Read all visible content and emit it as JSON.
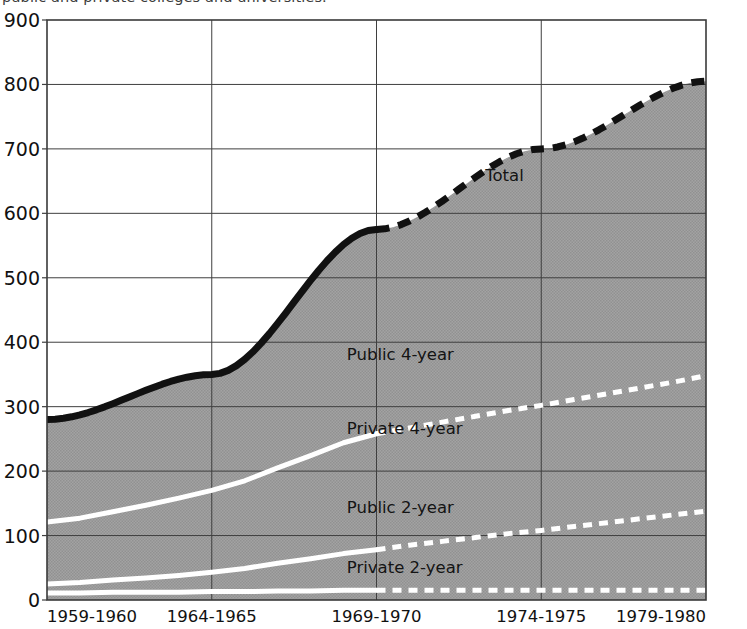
{
  "caption": {
    "text": "public and private colleges and universities."
  },
  "chart_data": {
    "type": "area",
    "title": "",
    "subtitle": "",
    "xlabel": "",
    "ylabel": "",
    "stacked": true,
    "grid": true,
    "legend_position": "inline",
    "xlim": [
      1959,
      1979
    ],
    "ylim": [
      0,
      900
    ],
    "yticks": [
      0,
      100,
      200,
      300,
      400,
      500,
      600,
      700,
      800,
      900
    ],
    "ytick_labels": [
      "0",
      "100",
      "200",
      "300",
      "400",
      "500",
      "600",
      "700",
      "800",
      "900"
    ],
    "xticks": [
      1959,
      1964,
      1969,
      1974,
      1979
    ],
    "xtick_labels": [
      "1959-1960",
      "1964-1965",
      "1969-1970",
      "1974-1975",
      "1979-1980"
    ],
    "projection_starts_at": 1969,
    "annotations": [
      {
        "name": "total",
        "text": "Total",
        "x": 1972.3,
        "y": 650
      },
      {
        "name": "public-4-year",
        "text": "Public 4-year",
        "x": 1968.1,
        "y": 372
      },
      {
        "name": "private-4-year",
        "text": "Private 4-year",
        "x": 1968.1,
        "y": 258
      },
      {
        "name": "public-2-year",
        "text": "Public 2-year",
        "x": 1968.1,
        "y": 135
      },
      {
        "name": "private-2-year",
        "text": "Private 2-year",
        "x": 1968.1,
        "y": 42
      }
    ],
    "x": [
      1959,
      1960,
      1961,
      1962,
      1963,
      1964,
      1965,
      1966,
      1967,
      1968,
      1969,
      1970,
      1971,
      1972,
      1973,
      1974,
      1975,
      1976,
      1977,
      1978,
      1979
    ],
    "series": [
      {
        "name": "Private 2-year",
        "label": "Private 2-year",
        "color": "#9a9a9a",
        "boundary_color": "#ffffff",
        "values": [
          11,
          11,
          12,
          12,
          12,
          13,
          13,
          14,
          14,
          15,
          15,
          15,
          15,
          15,
          15,
          15,
          15,
          15,
          15,
          15,
          15
        ]
      },
      {
        "name": "Public 2-year",
        "label": "Public 2-year",
        "color": "#9a9a9a",
        "boundary_color": "#ffffff",
        "values": [
          14,
          16,
          19,
          22,
          26,
          30,
          36,
          43,
          50,
          57,
          63,
          70,
          76,
          82,
          88,
          93,
          99,
          105,
          111,
          117,
          123
        ]
      },
      {
        "name": "Private 4-year",
        "label": "Private 4-year",
        "color": "#9a9a9a",
        "boundary_color": "#ffffff",
        "values": [
          96,
          100,
          106,
          113,
          120,
          127,
          136,
          148,
          160,
          172,
          180,
          182,
          185,
          188,
          191,
          194,
          197,
          200,
          203,
          206,
          210
        ]
      },
      {
        "name": "Public 4-year",
        "label": "Public 4-year",
        "color": "#9a9a9a",
        "boundary_color": "#ffffff",
        "values": [
          159,
          171,
          187,
          206,
          228,
          255,
          287,
          323,
          360,
          395,
          424,
          440,
          460,
          480,
          498,
          514,
          532,
          550,
          570,
          593,
          617
        ]
      }
    ],
    "total": {
      "name": "Total",
      "label": "Total",
      "color": "#111111",
      "values": [
        280,
        298,
        324,
        353,
        386,
        425,
        472,
        528,
        584,
        639,
        682,
        707,
        736,
        765,
        792,
        816,
        843,
        870,
        899,
        931,
        965
      ]
    },
    "cumulative_totals_displayed": {
      "1959-1960": 280,
      "1964-1965": 350,
      "1969-1970": 575,
      "1974-1975": 700,
      "1979-1980": 805
    },
    "stack_top_values": {
      "private_2_year": [
        11,
        11,
        12,
        12,
        12,
        13,
        13,
        14,
        14,
        15,
        15,
        15,
        15,
        15,
        15,
        15,
        15,
        15,
        15,
        15,
        15
      ],
      "public_2_year": [
        25,
        27,
        31,
        34,
        38,
        43,
        49,
        57,
        64,
        72,
        78,
        85,
        91,
        97,
        103,
        108,
        114,
        120,
        126,
        132,
        138
      ],
      "private_4_year": [
        121,
        127,
        137,
        147,
        158,
        170,
        185,
        205,
        224,
        244,
        258,
        267,
        276,
        285,
        294,
        302,
        311,
        320,
        329,
        338,
        348
      ],
      "public_4_year": [
        280,
        298,
        324,
        353,
        386,
        425,
        472,
        528,
        584,
        639,
        682,
        707,
        736,
        765,
        792,
        816,
        843,
        870,
        899,
        931,
        965
      ]
    }
  }
}
